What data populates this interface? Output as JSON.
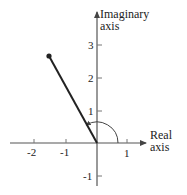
{
  "diagram": {
    "type": "complex-plane",
    "axes": {
      "x_label_line1": "Real",
      "x_label_line2": "axis",
      "y_label_line1": "Imaginary",
      "y_label_line2": "axis",
      "x_ticks": [
        "-2",
        "-1",
        "1"
      ],
      "y_ticks": [
        "3",
        "2",
        "1",
        "-1"
      ]
    },
    "vector": {
      "from": [
        0,
        0
      ],
      "to": [
        -1.5,
        2.6
      ],
      "endpoint_marker": "dot"
    },
    "angle_arc": {
      "from_deg": 0,
      "to_deg": 120,
      "arrow_at_end": true
    },
    "colors": {
      "ink": "#222222",
      "axis": "#555555"
    }
  }
}
